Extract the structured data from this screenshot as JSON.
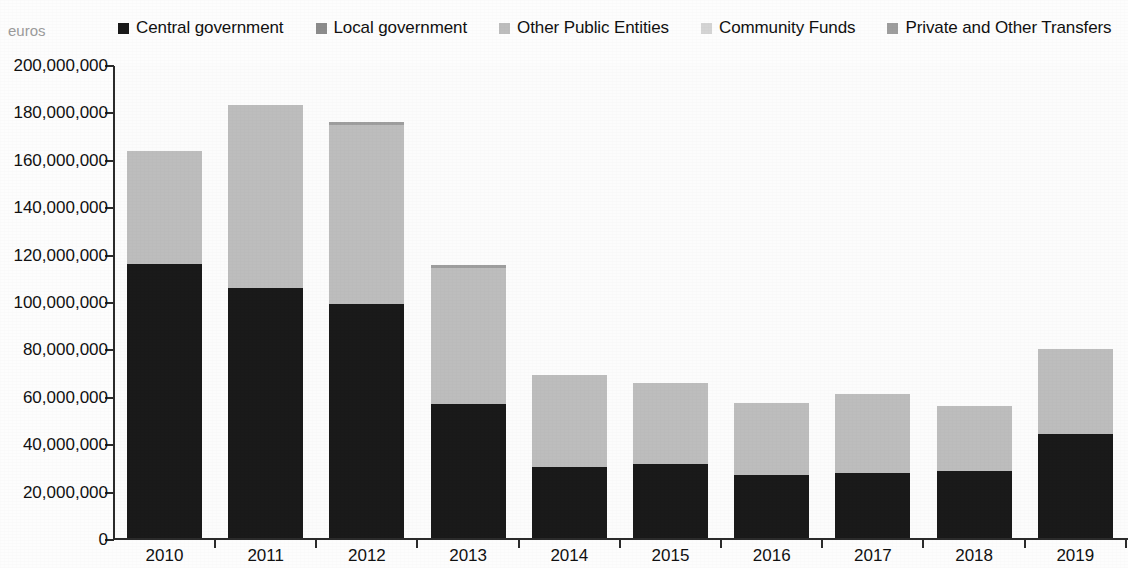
{
  "axis_unit_caption": "euros",
  "legend": {
    "items": [
      {
        "label": "Central government",
        "color": "#1a1a1a"
      },
      {
        "label": "Local government",
        "color": "#8c8c8c"
      },
      {
        "label": "Other Public Entities",
        "color": "#bdbdbd"
      },
      {
        "label": "Community Funds",
        "color": "#d4d4d4"
      },
      {
        "label": "Private and Other Transfers",
        "color": "#9e9e9e"
      }
    ]
  },
  "chart_data": {
    "type": "bar",
    "title": "",
    "subtitle": "",
    "xlabel": "",
    "ylabel": "euros",
    "stacked": true,
    "grid": false,
    "legend_position": "top",
    "ylim": [
      0,
      200000000
    ],
    "ytick_labels": [
      "200,000,000",
      "180,000,000",
      "160,000,000",
      "140,000,000",
      "120,000,000",
      "100,000,000",
      "80,000,000",
      "60,000,000",
      "40,000,000",
      "20,000,000",
      "0"
    ],
    "ytick_values": [
      200000000,
      180000000,
      160000000,
      140000000,
      120000000,
      100000000,
      80000000,
      60000000,
      40000000,
      20000000,
      0
    ],
    "categories": [
      "2010",
      "2011",
      "2012",
      "2013",
      "2014",
      "2015",
      "2016",
      "2017",
      "2018",
      "2019"
    ],
    "series": [
      {
        "name": "Central government",
        "color": "#1a1a1a",
        "values": [
          115700000,
          105500000,
          98700000,
          56500000,
          30100000,
          31200000,
          26500000,
          27400000,
          28400000,
          44000000
        ]
      },
      {
        "name": "Local government",
        "color": "#8c8c8c",
        "values": [
          0,
          0,
          0,
          0,
          0,
          0,
          0,
          0,
          0,
          0
        ]
      },
      {
        "name": "Other Public Entities",
        "color": "#bdbdbd",
        "values": [
          47800000,
          77100000,
          75500000,
          57300000,
          38600000,
          34400000,
          30400000,
          33500000,
          27200000,
          35600000
        ]
      },
      {
        "name": "Community Funds",
        "color": "#d4d4d4",
        "values": [
          0,
          0,
          0,
          0,
          0,
          0,
          0,
          0,
          0,
          0
        ]
      },
      {
        "name": "Private and Other Transfers",
        "color": "#9e9e9e",
        "values": [
          0,
          0,
          1300000,
          1300000,
          0,
          0,
          0,
          0,
          0,
          0
        ]
      }
    ],
    "totals": [
      163500000,
      182600000,
      175500000,
      115100000,
      68700000,
      65600000,
      56900000,
      60900000,
      55600000,
      79600000
    ]
  }
}
